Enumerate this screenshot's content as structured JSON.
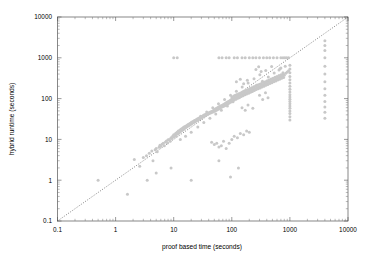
{
  "chart_data": {
    "type": "scatter",
    "title": "",
    "xlabel": "proof based time (seconds)",
    "ylabel": "hybrid runtime (seconds)",
    "xscale": "log",
    "yscale": "log",
    "xlim": [
      0.1,
      10000
    ],
    "ylim": [
      0.1,
      10000
    ],
    "xticks": [
      "0.1",
      "1",
      "10",
      "100",
      "1000",
      "10000"
    ],
    "yticks": [
      "0.1",
      "1",
      "10",
      "100",
      "1000",
      "10000"
    ],
    "xtick_values": [
      0.1,
      1,
      10,
      100,
      1000,
      10000
    ],
    "ytick_values": [
      0.1,
      1,
      10,
      100,
      1000,
      10000
    ],
    "grid": false,
    "legend": "none",
    "marker_color": "#c8c8c8",
    "marker_size": 1.5,
    "reference_line": {
      "name": "y = x diagonal",
      "style": "dotted",
      "color": "#4d4d4d",
      "from": [
        0.1,
        0.1
      ],
      "to": [
        10000,
        10000
      ]
    },
    "annotations": [
      "dense cluster of points follows the y = x diagonal",
      "horizontal timeout band of points at y = 1000",
      "vertical bands of points near x = 1000 and x = 4000"
    ],
    "points": [
      [
        0.5,
        1.0
      ],
      [
        1.6,
        0.45
      ],
      [
        2.1,
        3.2
      ],
      [
        2.6,
        2.2
      ],
      [
        3.0,
        3.6
      ],
      [
        3.4,
        4.0
      ],
      [
        3.8,
        4.6
      ],
      [
        4.2,
        5.2
      ],
      [
        4.4,
        3.0
      ],
      [
        4.8,
        5.6
      ],
      [
        5.0,
        6.0
      ],
      [
        5.2,
        5.0
      ],
      [
        5.6,
        6.4
      ],
      [
        5.8,
        7.2
      ],
      [
        6.0,
        6.8
      ],
      [
        6.3,
        7.6
      ],
      [
        6.6,
        8.0
      ],
      [
        6.9,
        7.0
      ],
      [
        7.2,
        8.6
      ],
      [
        7.5,
        9.2
      ],
      [
        7.8,
        8.2
      ],
      [
        8.0,
        9.8
      ],
      [
        8.4,
        10.0
      ],
      [
        8.7,
        9.0
      ],
      [
        9.0,
        11.0
      ],
      [
        9.3,
        10.5
      ],
      [
        9.6,
        12.0
      ],
      [
        10.0,
        11.5
      ],
      [
        10.0,
        13.0
      ],
      [
        10.4,
        12.5
      ],
      [
        10.8,
        14.0
      ],
      [
        11.0,
        12.0
      ],
      [
        11.4,
        15.0
      ],
      [
        11.8,
        13.5
      ],
      [
        12.0,
        16.0
      ],
      [
        12.4,
        14.5
      ],
      [
        12.8,
        17.0
      ],
      [
        13.0,
        15.5
      ],
      [
        13.5,
        18.0
      ],
      [
        14.0,
        16.5
      ],
      [
        14.3,
        19.0
      ],
      [
        14.8,
        17.5
      ],
      [
        15.0,
        20.0
      ],
      [
        15.4,
        18.5
      ],
      [
        15.9,
        21.0
      ],
      [
        16.2,
        19.5
      ],
      [
        16.8,
        22.0
      ],
      [
        17.0,
        20.5
      ],
      [
        17.5,
        23.0
      ],
      [
        18.0,
        21.5
      ],
      [
        18.4,
        24.0
      ],
      [
        18.9,
        22.5
      ],
      [
        19.3,
        25.0
      ],
      [
        19.8,
        23.5
      ],
      [
        20.0,
        26.0
      ],
      [
        20.5,
        24.5
      ],
      [
        21.0,
        27.0
      ],
      [
        21.6,
        25.5
      ],
      [
        22.0,
        28.0
      ],
      [
        22.5,
        26.5
      ],
      [
        23.0,
        29.0
      ],
      [
        23.6,
        27.5
      ],
      [
        24.0,
        30.0
      ],
      [
        24.6,
        28.5
      ],
      [
        25.0,
        31.0
      ],
      [
        25.5,
        29.5
      ],
      [
        26.0,
        32.0
      ],
      [
        26.7,
        30.5
      ],
      [
        27.0,
        33.0
      ],
      [
        27.6,
        31.5
      ],
      [
        28.0,
        34.0
      ],
      [
        28.7,
        32.5
      ],
      [
        29.0,
        35.0
      ],
      [
        29.7,
        33.5
      ],
      [
        30.0,
        36.0
      ],
      [
        30.8,
        34.5
      ],
      [
        31.0,
        37.0
      ],
      [
        31.8,
        35.5
      ],
      [
        32.0,
        38.0
      ],
      [
        32.9,
        36.5
      ],
      [
        33.0,
        39.0
      ],
      [
        33.9,
        37.5
      ],
      [
        34.0,
        40.0
      ],
      [
        35.0,
        38.5
      ],
      [
        35.5,
        41.0
      ],
      [
        36.0,
        39.5
      ],
      [
        36.8,
        42.0
      ],
      [
        37.0,
        40.5
      ],
      [
        38.0,
        43.0
      ],
      [
        38.5,
        41.5
      ],
      [
        39.0,
        44.0
      ],
      [
        40.0,
        42.5
      ],
      [
        40.5,
        45.0
      ],
      [
        41.0,
        43.5
      ],
      [
        42.0,
        46.0
      ],
      [
        43.0,
        44.5
      ],
      [
        43.5,
        47.0
      ],
      [
        44.0,
        45.5
      ],
      [
        45.0,
        48.0
      ],
      [
        46.0,
        46.5
      ],
      [
        47.0,
        50.0
      ],
      [
        48.0,
        47.5
      ],
      [
        49.0,
        52.0
      ],
      [
        50.0,
        49.0
      ],
      [
        51.0,
        54.0
      ],
      [
        52.0,
        50.5
      ],
      [
        53.0,
        56.0
      ],
      [
        54.0,
        52.0
      ],
      [
        55.0,
        58.0
      ],
      [
        56.0,
        53.5
      ],
      [
        57.0,
        60.0
      ],
      [
        58.0,
        55.0
      ],
      [
        59.0,
        62.0
      ],
      [
        60.0,
        57.0
      ],
      [
        62.0,
        64.0
      ],
      [
        63.0,
        59.0
      ],
      [
        64.0,
        66.0
      ],
      [
        66.0,
        61.0
      ],
      [
        67.0,
        68.0
      ],
      [
        69.0,
        63.0
      ],
      [
        70.0,
        70.0
      ],
      [
        72.0,
        65.0
      ],
      [
        73.0,
        73.0
      ],
      [
        75.0,
        67.0
      ],
      [
        77.0,
        76.0
      ],
      [
        78.0,
        69.0
      ],
      [
        80.0,
        79.0
      ],
      [
        82.0,
        72.0
      ],
      [
        84.0,
        82.0
      ],
      [
        86.0,
        75.0
      ],
      [
        88.0,
        85.0
      ],
      [
        90.0,
        78.0
      ],
      [
        92.0,
        88.0
      ],
      [
        94.0,
        81.0
      ],
      [
        96.0,
        92.0
      ],
      [
        98.0,
        84.0
      ],
      [
        100.0,
        96.0
      ],
      [
        100.0,
        110.0
      ],
      [
        103.0,
        88.0
      ],
      [
        105.0,
        100.0
      ],
      [
        108.0,
        115.0
      ],
      [
        110.0,
        92.0
      ],
      [
        112.0,
        105.0
      ],
      [
        115.0,
        120.0
      ],
      [
        118.0,
        97.0
      ],
      [
        120.0,
        110.0
      ],
      [
        123.0,
        126.0
      ],
      [
        126.0,
        102.0
      ],
      [
        129.0,
        116.0
      ],
      [
        132.0,
        132.0
      ],
      [
        135.0,
        107.0
      ],
      [
        138.0,
        122.0
      ],
      [
        141.0,
        138.0
      ],
      [
        145.0,
        112.0
      ],
      [
        148.0,
        128.0
      ],
      [
        152.0,
        145.0
      ],
      [
        156.0,
        118.0
      ],
      [
        160.0,
        134.0
      ],
      [
        164.0,
        152.0
      ],
      [
        168.0,
        124.0
      ],
      [
        172.0,
        140.0
      ],
      [
        176.0,
        160.0
      ],
      [
        180.0,
        130.0
      ],
      [
        185.0,
        147.0
      ],
      [
        190.0,
        168.0
      ],
      [
        195.0,
        136.0
      ],
      [
        200.0,
        154.0
      ],
      [
        205.0,
        176.0
      ],
      [
        210.0,
        143.0
      ],
      [
        215.0,
        162.0
      ],
      [
        220.0,
        185.0
      ],
      [
        226.0,
        150.0
      ],
      [
        232.0,
        170.0
      ],
      [
        238.0,
        194.0
      ],
      [
        244.0,
        158.0
      ],
      [
        250.0,
        178.0
      ],
      [
        256.0,
        204.0
      ],
      [
        263.0,
        166.0
      ],
      [
        270.0,
        187.0
      ],
      [
        277.0,
        214.0
      ],
      [
        284.0,
        174.0
      ],
      [
        291.0,
        196.0
      ],
      [
        299.0,
        225.0
      ],
      [
        307.0,
        183.0
      ],
      [
        315.0,
        206.0
      ],
      [
        323.0,
        236.0
      ],
      [
        331.0,
        192.0
      ],
      [
        340.0,
        216.0
      ],
      [
        349.0,
        248.0
      ],
      [
        358.0,
        202.0
      ],
      [
        367.0,
        227.0
      ],
      [
        377.0,
        260.0
      ],
      [
        387.0,
        212.0
      ],
      [
        397.0,
        238.0
      ],
      [
        407.0,
        273.0
      ],
      [
        418.0,
        223.0
      ],
      [
        429.0,
        250.0
      ],
      [
        440.0,
        287.0
      ],
      [
        451.0,
        234.0
      ],
      [
        463.0,
        263.0
      ],
      [
        475.0,
        301.0
      ],
      [
        488.0,
        246.0
      ],
      [
        500.0,
        276.0
      ],
      [
        513.0,
        316.0
      ],
      [
        527.0,
        258.0
      ],
      [
        541.0,
        290.0
      ],
      [
        555.0,
        332.0
      ],
      [
        570.0,
        271.0
      ],
      [
        585.0,
        305.0
      ],
      [
        600.0,
        349.0
      ],
      [
        616.0,
        285.0
      ],
      [
        632.0,
        320.0
      ],
      [
        649.0,
        366.0
      ],
      [
        666.0,
        299.0
      ],
      [
        684.0,
        336.0
      ],
      [
        702.0,
        384.0
      ],
      [
        720.0,
        314.0
      ],
      [
        739.0,
        353.0
      ],
      [
        759.0,
        403.0
      ],
      [
        779.0,
        330.0
      ],
      [
        800.0,
        371.0
      ],
      [
        850.0,
        420.0
      ],
      [
        900.0,
        450.0
      ],
      [
        950.0,
        480.0
      ],
      [
        13.0,
        10.0
      ],
      [
        16.0,
        12.0
      ],
      [
        20.0,
        15.0
      ],
      [
        26.0,
        20.0
      ],
      [
        33.0,
        26.0
      ],
      [
        42.0,
        33.0
      ],
      [
        53.0,
        42.0
      ],
      [
        66.0,
        52.0
      ],
      [
        84.0,
        66.0
      ],
      [
        105.0,
        84.0
      ],
      [
        133.0,
        105.0
      ],
      [
        168.0,
        133.0
      ],
      [
        212.0,
        168.0
      ],
      [
        267.0,
        212.0
      ],
      [
        337.0,
        267.0
      ],
      [
        425.0,
        337.0
      ],
      [
        536.0,
        425.0
      ],
      [
        676.0,
        536.0
      ],
      [
        11.0,
        14.0
      ],
      [
        14.0,
        18.0
      ],
      [
        18.0,
        23.0
      ],
      [
        23.0,
        29.0
      ],
      [
        29.0,
        37.0
      ],
      [
        37.0,
        47.0
      ],
      [
        47.0,
        60.0
      ],
      [
        59.0,
        75.0
      ],
      [
        75.0,
        95.0
      ],
      [
        95.0,
        120.0
      ],
      [
        120.0,
        152.0
      ],
      [
        151.0,
        192.0
      ],
      [
        191.0,
        242.0
      ],
      [
        241.0,
        306.0
      ],
      [
        304.0,
        386.0
      ],
      [
        384.0,
        488.0
      ],
      [
        485.0,
        615.0
      ],
      [
        45.0,
        8.5
      ],
      [
        50.0,
        7.5
      ],
      [
        55.0,
        8.0
      ],
      [
        60.0,
        6.5
      ],
      [
        66.0,
        7.0
      ],
      [
        72.0,
        9.0
      ],
      [
        80.0,
        6.0
      ],
      [
        90.0,
        8.0
      ],
      [
        100.0,
        10.0
      ],
      [
        110.0,
        12.0
      ],
      [
        125.0,
        11.0
      ],
      [
        140.0,
        14.0
      ],
      [
        160.0,
        13.0
      ],
      [
        180.0,
        16.0
      ],
      [
        200.0,
        15.0
      ],
      [
        60.0,
        3.0
      ],
      [
        130.0,
        2.0
      ],
      [
        95.0,
        1.2
      ],
      [
        20.0,
        1.0
      ],
      [
        9.0,
        2.0
      ],
      [
        5.0,
        1.5
      ],
      [
        3.5,
        1.0
      ],
      [
        10.0,
        1000.0
      ],
      [
        11.5,
        1000.0
      ],
      [
        60.0,
        1000.0
      ],
      [
        68.0,
        1000.0
      ],
      [
        80.0,
        1000.0
      ],
      [
        90.0,
        1000.0
      ],
      [
        110.0,
        1000.0
      ],
      [
        125.0,
        1000.0
      ],
      [
        150.0,
        1000.0
      ],
      [
        170.0,
        1000.0
      ],
      [
        200.0,
        1000.0
      ],
      [
        230.0,
        1000.0
      ],
      [
        260.0,
        1000.0
      ],
      [
        300.0,
        1000.0
      ],
      [
        350.0,
        1000.0
      ],
      [
        400.0,
        1000.0
      ],
      [
        450.0,
        1000.0
      ],
      [
        520.0,
        1000.0
      ],
      [
        600.0,
        1000.0
      ],
      [
        700.0,
        1000.0
      ],
      [
        760.0,
        1000.0
      ],
      [
        820.0,
        1000.0
      ],
      [
        880.0,
        1000.0
      ],
      [
        950.0,
        1000.0
      ],
      [
        1000.0,
        30.0
      ],
      [
        1000.0,
        36.0
      ],
      [
        1000.0,
        43.0
      ],
      [
        1000.0,
        50.0
      ],
      [
        1000.0,
        58.0
      ],
      [
        1000.0,
        66.0
      ],
      [
        1000.0,
        75.0
      ],
      [
        1000.0,
        85.0
      ],
      [
        1000.0,
        96.0
      ],
      [
        1000.0,
        110.0
      ],
      [
        1000.0,
        125.0
      ],
      [
        1000.0,
        145.0
      ],
      [
        1000.0,
        170.0
      ],
      [
        1000.0,
        200.0
      ],
      [
        1000.0,
        240.0
      ],
      [
        1000.0,
        290.0
      ],
      [
        1000.0,
        350.0
      ],
      [
        1000.0,
        430.0
      ],
      [
        1000.0,
        530.0
      ],
      [
        1000.0,
        660.0
      ],
      [
        4000.0,
        33.0
      ],
      [
        4000.0,
        46.0
      ],
      [
        4000.0,
        62.0
      ],
      [
        4000.0,
        85.0
      ],
      [
        4000.0,
        120.0
      ],
      [
        4000.0,
        175.0
      ],
      [
        4000.0,
        260.0
      ],
      [
        4000.0,
        400.0
      ],
      [
        4000.0,
        620.0
      ],
      [
        4000.0,
        1000.0
      ],
      [
        4000.0,
        1500.0
      ],
      [
        4000.0,
        2000.0
      ],
      [
        4000.0,
        2600.0
      ],
      [
        650.0,
        500.0
      ],
      [
        700.0,
        560.0
      ],
      [
        760.0,
        430.0
      ],
      [
        830.0,
        620.0
      ],
      [
        300.0,
        120.0
      ],
      [
        340.0,
        95.0
      ],
      [
        380.0,
        140.0
      ],
      [
        420.0,
        105.0
      ],
      [
        260.0,
        520.0
      ],
      [
        290.0,
        600.0
      ],
      [
        320.0,
        460.0
      ],
      [
        150.0,
        60.0
      ],
      [
        170.0,
        52.0
      ],
      [
        190.0,
        70.0
      ],
      [
        230.0,
        58.0
      ],
      [
        120.0,
        260.0
      ],
      [
        140.0,
        300.0
      ],
      [
        160.0,
        230.0
      ],
      [
        185.0,
        280.0
      ]
    ]
  },
  "axes": {
    "x_title": "proof based time (seconds)",
    "y_title": "hybrid runtime (seconds)"
  }
}
